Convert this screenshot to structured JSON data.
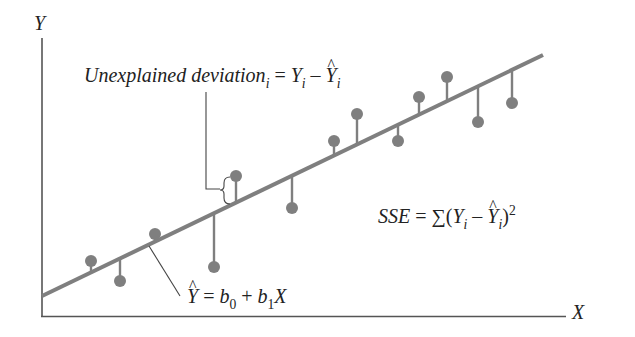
{
  "figure": {
    "axes": {
      "y_label": "Y",
      "x_label": "X"
    },
    "annotations": {
      "unexplained_deviation": {
        "prefix": "Unexplained deviation",
        "prefix_sub": "i",
        "equals": " = ",
        "y": "Y",
        "y_sub": "i",
        "minus": " – ",
        "yhat": "Y",
        "yhat_sub": "i"
      },
      "regression_equation": {
        "yhat": "Y",
        "equals": " = ",
        "b0": "b",
        "b0_sub": "0",
        "plus": " + ",
        "b1": "b",
        "b1_sub": "1",
        "x": "X"
      },
      "sse": {
        "name": "SSE",
        "equals": " = ",
        "sigma": "∑",
        "open": "(",
        "y": "Y",
        "y_sub": "i",
        "minus": " – ",
        "yhat": "Y",
        "yhat_sub": "i",
        "close": ")",
        "power": "2"
      }
    },
    "colors": {
      "regression_line": "#7f7f7f",
      "points": "#7f7f7f",
      "axes": "#555555",
      "text": "#222222"
    }
  },
  "chart_data": {
    "type": "scatter",
    "title": "",
    "xlabel": "X",
    "ylabel": "Y",
    "grid": false,
    "regression_line": {
      "equation": "Ŷ = b0 + b1X",
      "start_px": [
        42,
        296
      ],
      "end_px": [
        543,
        55
      ]
    },
    "points_px": [
      {
        "x": 91,
        "y": 261
      },
      {
        "x": 120,
        "y": 281
      },
      {
        "x": 155,
        "y": 234
      },
      {
        "x": 214,
        "y": 267
      },
      {
        "x": 236,
        "y": 176
      },
      {
        "x": 292,
        "y": 208
      },
      {
        "x": 334,
        "y": 141
      },
      {
        "x": 357,
        "y": 114
      },
      {
        "x": 398,
        "y": 141
      },
      {
        "x": 419,
        "y": 97
      },
      {
        "x": 447,
        "y": 77
      },
      {
        "x": 478,
        "y": 122
      },
      {
        "x": 512,
        "y": 103
      }
    ],
    "annotations": [
      "Unexplained deviation_i = Y_i − Ŷ_i",
      "Ŷ = b0 + b1X",
      "SSE = Σ(Y_i − Ŷ_i)^2"
    ]
  }
}
